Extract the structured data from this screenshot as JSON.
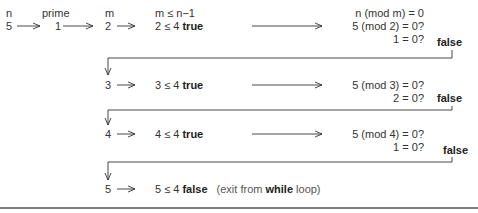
{
  "headers": {
    "n": "n",
    "prime": "prime",
    "m": "m",
    "condition": "m ≤ n−1",
    "mod_test": "n (mod m) = 0"
  },
  "initial": {
    "n": "5",
    "prime": "1",
    "m": "2"
  },
  "iterations": [
    {
      "m": "2",
      "cond_expr": "2 ≤ 4",
      "cond_result": "true",
      "mod_expr": "5 (mod 2) = 0?",
      "mod_eval": "1 = 0?",
      "mod_result": "false"
    },
    {
      "m": "3",
      "cond_expr": "3 ≤ 4",
      "cond_result": "true",
      "mod_expr": "5 (mod 3) = 0?",
      "mod_eval": "2 = 0?",
      "mod_result": "false"
    },
    {
      "m": "4",
      "cond_expr": "4 ≤ 4",
      "cond_result": "true",
      "mod_expr": "5 (mod 4) = 0?",
      "mod_eval": "1 = 0?",
      "mod_result": "false"
    },
    {
      "m": "5",
      "cond_expr": "5 ≤ 4",
      "cond_result": "false",
      "note_pre": "(exit from ",
      "note_bold": "while",
      "note_post": " loop)"
    }
  ],
  "colors": {
    "ink": "#333333",
    "bold": "#222222",
    "rule": "#555555"
  }
}
